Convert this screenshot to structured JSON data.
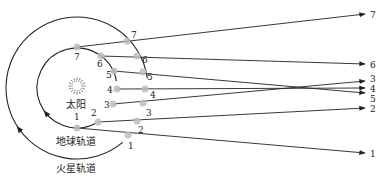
{
  "diagram": {
    "labels": {
      "sun": "太阳",
      "earth_orbit": "地球轨道",
      "mars_orbit": "火星轨道"
    },
    "colors": {
      "line": "#222222",
      "point": "#bdbdbd",
      "background": "#ffffff"
    },
    "sun": {
      "x": 77,
      "y": 88,
      "icon": "sun-icon"
    },
    "earth_orbit": {
      "cx": 77,
      "cy": 88,
      "r": 40
    },
    "mars_orbit": {
      "cx": 77,
      "cy": 88,
      "r": 71
    },
    "earth_positions": [
      {
        "id": "1",
        "x": 77,
        "y": 128,
        "lx": 74,
        "ly": 120
      },
      {
        "id": "2",
        "x": 98,
        "y": 122,
        "lx": 91,
        "ly": 116
      },
      {
        "id": "3",
        "x": 113,
        "y": 104,
        "lx": 104,
        "ly": 108
      },
      {
        "id": "4",
        "x": 117,
        "y": 89,
        "lx": 107,
        "ly": 93
      },
      {
        "id": "5",
        "x": 114,
        "y": 71,
        "lx": 106,
        "ly": 78
      },
      {
        "id": "6",
        "x": 101,
        "y": 56,
        "lx": 97,
        "ly": 67
      },
      {
        "id": "7",
        "x": 77,
        "y": 47,
        "lx": 74,
        "ly": 60
      }
    ],
    "mars_positions": [
      {
        "id": "1",
        "x": 128,
        "y": 135,
        "lx": 128,
        "ly": 149
      },
      {
        "id": "2",
        "x": 137,
        "y": 121,
        "lx": 138,
        "ly": 133
      },
      {
        "id": "3",
        "x": 143,
        "y": 103,
        "lx": 146,
        "ly": 116
      },
      {
        "id": "4",
        "x": 145,
        "y": 89,
        "lx": 150,
        "ly": 98
      },
      {
        "id": "5",
        "x": 143,
        "y": 72,
        "lx": 147,
        "ly": 80
      },
      {
        "id": "6",
        "x": 137,
        "y": 56,
        "lx": 142,
        "ly": 63
      },
      {
        "id": "7",
        "x": 127,
        "y": 41,
        "lx": 131,
        "ly": 38
      }
    ],
    "sight_lines": [
      {
        "id": "1",
        "end_x": 365,
        "end_y": 153,
        "label": "1",
        "label_y": 157
      },
      {
        "id": "2",
        "end_x": 365,
        "end_y": 108,
        "label": "2",
        "label_y": 112
      },
      {
        "id": "3",
        "end_x": 365,
        "end_y": 81,
        "label": "3",
        "label_y": 82
      },
      {
        "id": "4",
        "end_x": 365,
        "end_y": 88,
        "label": "4",
        "label_y": 92
      },
      {
        "id": "5",
        "end_x": 365,
        "end_y": 93,
        "label": "5",
        "label_y": 102
      },
      {
        "id": "6",
        "end_x": 365,
        "end_y": 64,
        "label": "6",
        "label_y": 68
      },
      {
        "id": "7",
        "end_x": 365,
        "end_y": 14,
        "label": "7",
        "label_y": 18
      }
    ]
  }
}
